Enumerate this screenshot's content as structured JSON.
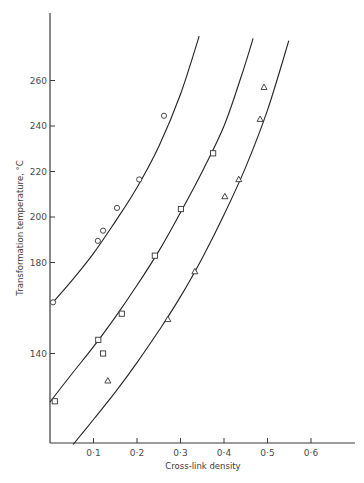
{
  "chart_data": {
    "type": "scatter",
    "title": "",
    "xlabel": "Cross-link density",
    "ylabel": "Transformation temperature, °C",
    "xlim": [
      0,
      0.7
    ],
    "ylim": [
      100,
      290
    ],
    "grid": false,
    "legend": null,
    "x_ticks": [
      {
        "value": 0.1,
        "label": "0·1"
      },
      {
        "value": 0.2,
        "label": "0·2"
      },
      {
        "value": 0.3,
        "label": "0·3"
      },
      {
        "value": 0.4,
        "label": "0·4"
      },
      {
        "value": 0.5,
        "label": "0·5"
      },
      {
        "value": 0.6,
        "label": "0·6"
      }
    ],
    "y_ticks": [
      {
        "value": 140,
        "label": "140"
      },
      {
        "value": 180,
        "label": "180"
      },
      {
        "value": 200,
        "label": "200"
      },
      {
        "value": 220,
        "label": "220"
      },
      {
        "value": 240,
        "label": "240"
      },
      {
        "value": 260,
        "label": "260"
      }
    ],
    "series": [
      {
        "name": "circles",
        "marker": "circle",
        "points": [
          {
            "x": 0.007,
            "y": 162.5
          },
          {
            "x": 0.11,
            "y": 189.5
          },
          {
            "x": 0.122,
            "y": 194
          },
          {
            "x": 0.154,
            "y": 204
          },
          {
            "x": 0.205,
            "y": 216.5
          },
          {
            "x": 0.262,
            "y": 244.5
          }
        ],
        "fit_curve": [
          {
            "x": 0.007,
            "y": 162.5
          },
          {
            "x": 0.05,
            "y": 172
          },
          {
            "x": 0.1,
            "y": 184
          },
          {
            "x": 0.15,
            "y": 198
          },
          {
            "x": 0.2,
            "y": 213
          },
          {
            "x": 0.25,
            "y": 231
          },
          {
            "x": 0.3,
            "y": 254
          },
          {
            "x": 0.343,
            "y": 279.5
          }
        ]
      },
      {
        "name": "squares",
        "marker": "square",
        "points": [
          {
            "x": 0.011,
            "y": 119
          },
          {
            "x": 0.111,
            "y": 146
          },
          {
            "x": 0.122,
            "y": 140
          },
          {
            "x": 0.165,
            "y": 157.5
          },
          {
            "x": 0.241,
            "y": 183
          },
          {
            "x": 0.301,
            "y": 203.5
          },
          {
            "x": 0.375,
            "y": 228
          }
        ],
        "fit_curve": [
          {
            "x": 0.0,
            "y": 118.7
          },
          {
            "x": 0.05,
            "y": 131
          },
          {
            "x": 0.1,
            "y": 143
          },
          {
            "x": 0.15,
            "y": 156
          },
          {
            "x": 0.2,
            "y": 170
          },
          {
            "x": 0.25,
            "y": 185
          },
          {
            "x": 0.3,
            "y": 202
          },
          {
            "x": 0.35,
            "y": 220
          },
          {
            "x": 0.4,
            "y": 240
          },
          {
            "x": 0.44,
            "y": 262
          },
          {
            "x": 0.467,
            "y": 278.5
          }
        ]
      },
      {
        "name": "triangles",
        "marker": "triangle",
        "points": [
          {
            "x": 0.133,
            "y": 128
          },
          {
            "x": 0.271,
            "y": 155
          },
          {
            "x": 0.333,
            "y": 176
          },
          {
            "x": 0.402,
            "y": 209
          },
          {
            "x": 0.434,
            "y": 216.5
          },
          {
            "x": 0.483,
            "y": 243
          },
          {
            "x": 0.492,
            "y": 257
          }
        ],
        "fit_curve": [
          {
            "x": 0.053,
            "y": 100
          },
          {
            "x": 0.1,
            "y": 111
          },
          {
            "x": 0.15,
            "y": 123
          },
          {
            "x": 0.2,
            "y": 136
          },
          {
            "x": 0.25,
            "y": 150
          },
          {
            "x": 0.3,
            "y": 165
          },
          {
            "x": 0.35,
            "y": 182
          },
          {
            "x": 0.4,
            "y": 201
          },
          {
            "x": 0.45,
            "y": 222
          },
          {
            "x": 0.5,
            "y": 247
          },
          {
            "x": 0.549,
            "y": 277.5
          }
        ]
      }
    ]
  },
  "layout": {
    "origin_px": [
      50,
      217
    ],
    "origin_value": [
      0,
      200
    ],
    "px_per_x_unit": 435,
    "px_per_y_unit": 2.275,
    "axis_top_px": 13,
    "axis_bottom_px": 443,
    "axis_right_px": 355
  }
}
